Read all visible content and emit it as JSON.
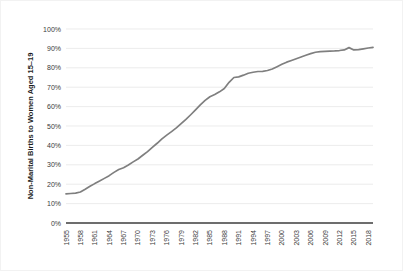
{
  "chart_data": {
    "type": "line",
    "title": "",
    "xlabel": "",
    "ylabel": "Non-Marital Births to Women Aged  15–19",
    "ylim": [
      0,
      100
    ],
    "yticks": [
      0,
      10,
      20,
      30,
      40,
      50,
      60,
      70,
      80,
      90,
      100
    ],
    "ytick_labels": [
      "0%",
      "10%",
      "20%",
      "30%",
      "40%",
      "50%",
      "60%",
      "70%",
      "80%",
      "90%",
      "100%"
    ],
    "xlim": [
      1955,
      2019
    ],
    "xtick_labels": [
      "1955",
      "1958",
      "1961",
      "1964",
      "1967",
      "1970",
      "1973",
      "1976",
      "1979",
      "1982",
      "1985",
      "1988",
      "1991",
      "1994",
      "1997",
      "2000",
      "2003",
      "2006",
      "2009",
      "2012",
      "2015",
      "2018"
    ],
    "grid": "horizontal",
    "legend": "none",
    "series": [
      {
        "name": "Non-Marital Births to Women Aged 15-19",
        "color": "#7f7f7f",
        "x": [
          1955,
          1956,
          1957,
          1958,
          1959,
          1960,
          1961,
          1962,
          1963,
          1964,
          1965,
          1966,
          1967,
          1968,
          1969,
          1970,
          1971,
          1972,
          1973,
          1974,
          1975,
          1976,
          1977,
          1978,
          1979,
          1980,
          1981,
          1982,
          1983,
          1984,
          1985,
          1986,
          1987,
          1988,
          1989,
          1990,
          1991,
          1992,
          1993,
          1994,
          1995,
          1996,
          1997,
          1998,
          1999,
          2000,
          2001,
          2002,
          2003,
          2004,
          2005,
          2006,
          2007,
          2008,
          2009,
          2010,
          2011,
          2012,
          2013,
          2014,
          2015,
          2016,
          2017,
          2018,
          2019
        ],
        "values": [
          15.0,
          15.2,
          15.4,
          16.0,
          17.4,
          18.9,
          20.3,
          21.6,
          23.0,
          24.4,
          26.1,
          27.6,
          28.5,
          29.9,
          31.5,
          33.0,
          34.9,
          36.8,
          39.0,
          41.1,
          43.4,
          45.3,
          47.1,
          49.0,
          51.2,
          53.4,
          55.8,
          58.3,
          60.9,
          63.2,
          65.1,
          66.2,
          67.6,
          69.3,
          72.5,
          75.0,
          75.3,
          76.2,
          77.2,
          77.7,
          78.1,
          78.2,
          78.6,
          79.4,
          80.6,
          81.8,
          82.9,
          83.8,
          84.7,
          85.6,
          86.5,
          87.3,
          88.0,
          88.3,
          88.5,
          88.6,
          88.7,
          88.9,
          89.2,
          90.4,
          89.2,
          89.4,
          89.8,
          90.2,
          90.5
        ]
      }
    ]
  }
}
